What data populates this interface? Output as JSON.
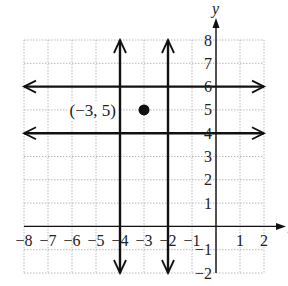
{
  "figure": {
    "axes": {
      "x_label": "x",
      "y_label": "y",
      "x_range": [
        -8,
        2
      ],
      "y_range": [
        -2,
        8
      ],
      "x_ticks": [
        {
          "v": -8,
          "t": "−8"
        },
        {
          "v": -7,
          "t": "−7"
        },
        {
          "v": -6,
          "t": "−6"
        },
        {
          "v": -5,
          "t": "−5"
        },
        {
          "v": -4,
          "t": "−4"
        },
        {
          "v": -3,
          "t": "−3"
        },
        {
          "v": -2,
          "t": "−2"
        },
        {
          "v": -1,
          "t": "−1"
        },
        {
          "v": 1,
          "t": "1"
        },
        {
          "v": 2,
          "t": "2"
        }
      ],
      "y_ticks": [
        {
          "v": 8,
          "t": "8"
        },
        {
          "v": 7,
          "t": "7"
        },
        {
          "v": 6,
          "t": "6"
        },
        {
          "v": 5,
          "t": "5"
        },
        {
          "v": 4,
          "t": "4"
        },
        {
          "v": 3,
          "t": "3"
        },
        {
          "v": 2,
          "t": "2"
        },
        {
          "v": 1,
          "t": "1"
        },
        {
          "v": -1,
          "t": "−1"
        },
        {
          "v": -2,
          "t": "−2"
        }
      ],
      "grid": true
    },
    "lines": [
      {
        "type": "horizontal",
        "equation": "y = 6",
        "value": 6
      },
      {
        "type": "horizontal",
        "equation": "y = 4",
        "value": 4
      },
      {
        "type": "vertical",
        "equation": "x = -4",
        "value": -4
      },
      {
        "type": "vertical",
        "equation": "x = -2",
        "value": -2
      }
    ],
    "point": {
      "x": -3,
      "y": 5,
      "label": "(−3, 5)"
    },
    "colors": {
      "grid": "#b8b8b8",
      "ink": "#111111",
      "background": "#ffffff"
    }
  }
}
